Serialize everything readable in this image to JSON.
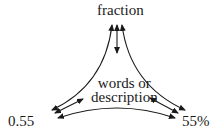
{
  "diagram": {
    "nodes": {
      "top": "fraction",
      "center_line1": "words or",
      "center_line2": "description",
      "bottom_left": "0.55",
      "bottom_right": "55%"
    },
    "edges": [
      {
        "from": "fraction",
        "to": "0.55",
        "style": "curved double arrow"
      },
      {
        "from": "fraction",
        "to": "55%",
        "style": "curved double arrow"
      },
      {
        "from": "0.55",
        "to": "55%",
        "style": "curved double arrow"
      },
      {
        "from": "fraction",
        "to": "words or description",
        "style": "double arrow"
      },
      {
        "from": "0.55",
        "to": "words or description",
        "style": "double arrow"
      },
      {
        "from": "55%",
        "to": "words or description",
        "style": "double arrow"
      }
    ],
    "line_color": "#1a1a1a"
  }
}
